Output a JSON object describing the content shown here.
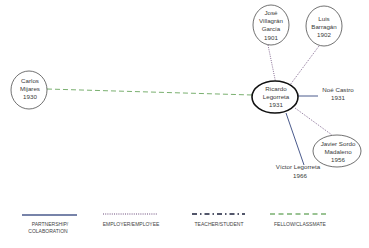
{
  "diagram": {
    "type": "influence-network",
    "center": {
      "id": "legorreta",
      "lines": [
        "Ricardo",
        "Legorreta",
        "1931"
      ]
    },
    "nodes": [
      {
        "id": "villagran",
        "lines": [
          "José",
          "Villagrán",
          "García",
          "1901"
        ],
        "circled": true
      },
      {
        "id": "barragan",
        "lines": [
          "Luis",
          "Barragán",
          "1902"
        ],
        "circled": true
      },
      {
        "id": "mijares",
        "lines": [
          "Carlos",
          "Mijares",
          "1930"
        ],
        "circled": true
      },
      {
        "id": "castro",
        "lines": [
          "Noé Castro",
          "1931"
        ],
        "circled": false
      },
      {
        "id": "sordo",
        "lines": [
          "Javier Sordo",
          "Madaleno",
          "1956"
        ],
        "circled": true
      },
      {
        "id": "victor",
        "lines": [
          "Víctor Legorreta",
          "1966"
        ],
        "circled": false
      }
    ],
    "edges": [
      {
        "from": "villagran",
        "to": "legorreta",
        "type": "employer-employee"
      },
      {
        "from": "barragan",
        "to": "legorreta",
        "type": "employer-employee"
      },
      {
        "from": "mijares",
        "to": "legorreta",
        "type": "fellow-classmate"
      },
      {
        "from": "castro",
        "to": "legorreta",
        "type": "partnership-collaboration"
      },
      {
        "from": "sordo",
        "to": "legorreta",
        "type": "employer-employee"
      },
      {
        "from": "victor",
        "to": "legorreta",
        "type": "partnership-collaboration"
      }
    ]
  },
  "legend": [
    {
      "key": "partnership",
      "lines": [
        "PARTNERSHIP/",
        "COLABORATION"
      ],
      "style": "solid",
      "color": "#4a5a8c"
    },
    {
      "key": "employer",
      "lines": [
        "EMPLOYER/EMPLOYEE"
      ],
      "style": "dotted",
      "color": "#6a4a7a"
    },
    {
      "key": "teacher",
      "lines": [
        "TEACHER/STUDENT"
      ],
      "style": "dash-dot",
      "color": "#1a1f3a"
    },
    {
      "key": "fellow",
      "lines": [
        "FELLOW/CLASSMATE"
      ],
      "style": "dashed",
      "color": "#7ab070"
    }
  ],
  "colors": {
    "partnership": "#4a5a8c",
    "employer": "#6a4a7a",
    "teacher": "#1a1f3a",
    "fellow": "#7ab070",
    "node_stroke": "#333333",
    "center_stroke": "#111111"
  }
}
